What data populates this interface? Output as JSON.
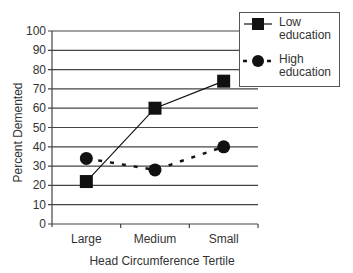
{
  "chart_data": {
    "type": "line",
    "title": "",
    "xlabel": "Head Circumference Tertile",
    "ylabel": "Percent Demented",
    "categories": [
      "Large",
      "Medium",
      "Small"
    ],
    "ylim": [
      0,
      100
    ],
    "yticks": [
      0,
      10,
      20,
      30,
      40,
      50,
      60,
      70,
      80,
      90,
      100
    ],
    "grid": true,
    "legend_position": "top-right",
    "series": [
      {
        "name": "Low education",
        "marker": "square",
        "line": "solid",
        "values": [
          22,
          60,
          74
        ]
      },
      {
        "name": "High education",
        "marker": "circle",
        "line": "dashed",
        "values": [
          34,
          28,
          40
        ]
      }
    ]
  },
  "legend": {
    "low": [
      "Low",
      "education"
    ],
    "high": [
      "High",
      "education"
    ]
  },
  "colors": {
    "line": "#111111",
    "grid": "#555555",
    "text": "#333333"
  }
}
